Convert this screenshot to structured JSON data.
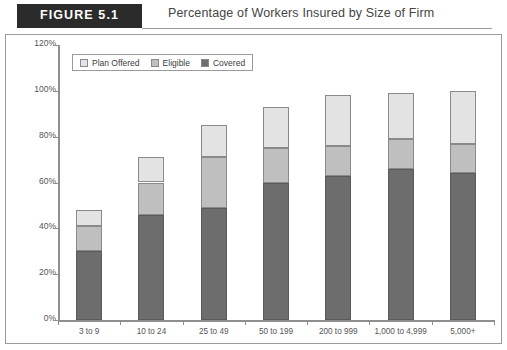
{
  "header": {
    "figure_label": "FIGURE 5.1",
    "title": "Percentage of Workers Insured by Size of Firm"
  },
  "legend": {
    "items": [
      {
        "label": "Plan Offered",
        "color": "#e3e3e3",
        "swatch_name": "legend-swatch-plan-offered"
      },
      {
        "label": "Eligible",
        "color": "#bfbfbf",
        "swatch_name": "legend-swatch-eligible"
      },
      {
        "label": "Covered",
        "color": "#6d6d6d",
        "swatch_name": "legend-swatch-covered"
      }
    ]
  },
  "axes": {
    "y_ticks": [
      "120%",
      "100%",
      "80%",
      "60%",
      "40%",
      "20%",
      "0%"
    ],
    "y_tick_values": [
      120,
      100,
      80,
      60,
      40,
      20,
      0
    ]
  },
  "chart_data": {
    "type": "bar",
    "stacked": true,
    "title": "Percentage of Workers Insured by Size of Firm",
    "xlabel": "",
    "ylabel": "",
    "ylim": [
      0,
      120
    ],
    "ytick_step": 20,
    "grid": false,
    "legend_position": "top-left-inside",
    "categories": [
      "3 to 9",
      "10 to 24",
      "25 to 49",
      "50 to 199",
      "200 to 999",
      "1,000 to 4,999",
      "5,000+"
    ],
    "cumulative_tops": {
      "covered": [
        30,
        46,
        49,
        60,
        63,
        66,
        64
      ],
      "eligible": [
        41,
        60,
        71,
        75,
        76,
        79,
        77
      ],
      "plan_offered": [
        48,
        71,
        85,
        93,
        98,
        99,
        100
      ]
    },
    "series": [
      {
        "name": "Covered",
        "color": "#6d6d6d",
        "values": [
          30,
          46,
          49,
          60,
          63,
          66,
          64
        ]
      },
      {
        "name": "Eligible",
        "color": "#bfbfbf",
        "values": [
          11,
          14,
          22,
          15,
          13,
          13,
          13
        ]
      },
      {
        "name": "Plan Offered",
        "color": "#e3e3e3",
        "values": [
          7,
          11,
          14,
          18,
          22,
          20,
          23
        ]
      }
    ]
  }
}
